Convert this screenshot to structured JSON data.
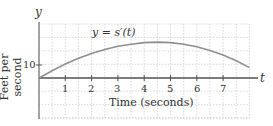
{
  "chart_data": {
    "type": "line",
    "title": "",
    "curve_label": "y = s′(t)",
    "xlabel": "Time (seconds)",
    "ylabel": "Feet per second",
    "x_axis_symbol": "t",
    "y_axis_symbol": "y",
    "x_ticks": [
      "1",
      "2",
      "3",
      "4",
      "5",
      "6",
      "7"
    ],
    "y_ticks": [
      "10"
    ],
    "xlim": [
      0,
      8
    ],
    "grid": true,
    "series": [
      {
        "name": "s′(t)",
        "x": [
          0,
          0.5,
          1,
          1.5,
          2,
          2.5,
          3,
          3.5,
          4,
          4.5,
          5,
          5.5,
          6,
          6.5,
          7,
          7.5,
          8
        ],
        "values": [
          7.5,
          8.9,
          10.2,
          11.3,
          12.2,
          13.0,
          13.6,
          14.0,
          14.3,
          14.4,
          14.3,
          14.0,
          13.5,
          12.8,
          11.9,
          10.8,
          9.5
        ]
      }
    ],
    "colors": {
      "curve": "#8a8a8a",
      "axis": "#555555",
      "grid": "#c8c8c8"
    }
  }
}
